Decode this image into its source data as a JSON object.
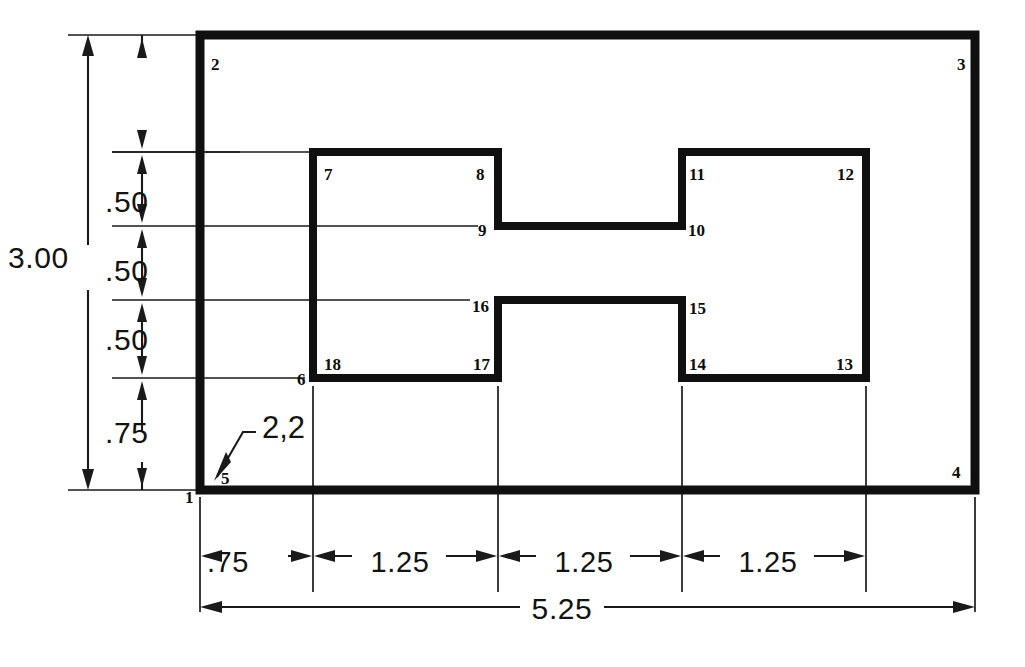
{
  "drawing": {
    "type": "orthographic-part-outline",
    "units": "inches",
    "overall_width": "5.25",
    "overall_height": "3.00"
  },
  "vertex_labels": [
    {
      "id": "1",
      "text": "1",
      "x": 185,
      "y": 503
    },
    {
      "id": "2",
      "text": "2",
      "x": 211,
      "y": 70
    },
    {
      "id": "3",
      "text": "3",
      "x": 957,
      "y": 70
    },
    {
      "id": "4",
      "text": "4",
      "x": 952,
      "y": 478
    },
    {
      "id": "5",
      "text": "5",
      "x": 221,
      "y": 484
    },
    {
      "id": "6",
      "text": "6",
      "x": 297,
      "y": 385
    },
    {
      "id": "7",
      "text": "7",
      "x": 324,
      "y": 180
    },
    {
      "id": "8",
      "text": "8",
      "x": 476,
      "y": 180
    },
    {
      "id": "9",
      "text": "9",
      "x": 478,
      "y": 236
    },
    {
      "id": "10",
      "text": "10",
      "x": 688,
      "y": 236
    },
    {
      "id": "11",
      "text": "11",
      "x": 689,
      "y": 180
    },
    {
      "id": "12",
      "text": "12",
      "x": 837,
      "y": 180
    },
    {
      "id": "13",
      "text": "13",
      "x": 836,
      "y": 370
    },
    {
      "id": "14",
      "text": "14",
      "x": 689,
      "y": 370
    },
    {
      "id": "15",
      "text": "15",
      "x": 689,
      "y": 314
    },
    {
      "id": "16",
      "text": "16",
      "x": 472,
      "y": 312
    },
    {
      "id": "17",
      "text": "17",
      "x": 473,
      "y": 370
    },
    {
      "id": "18",
      "text": "18",
      "x": 324,
      "y": 370
    }
  ],
  "leader_note": {
    "label": "2,2",
    "text_x": 262,
    "text_y": 438,
    "tip_x": 214,
    "tip_y": 480
  },
  "vertical_dimensions": {
    "overall": {
      "label": "3.00",
      "text_x": 8,
      "text_y": 268
    },
    "chain": [
      {
        "label": ".50",
        "text_x": 105,
        "text_y": 212
      },
      {
        "label": ".50",
        "text_x": 105,
        "text_y": 281
      },
      {
        "label": ".50",
        "text_x": 105,
        "text_y": 350
      },
      {
        "label": ".75",
        "text_x": 105,
        "text_y": 443
      }
    ]
  },
  "horizontal_dimensions": {
    "overall": {
      "label": "5.25",
      "text_x": 556,
      "text_y": 623
    },
    "chain": [
      {
        "label": ".75",
        "text_x": 228,
        "text_y": 572
      },
      {
        "label": "1.25",
        "text_x": 372,
        "text_y": 572
      },
      {
        "label": "1.25",
        "text_x": 556,
        "text_y": 572
      },
      {
        "label": "1.25",
        "text_x": 740,
        "text_y": 572
      }
    ]
  },
  "colors": {
    "ink": "#101010",
    "thin_line": "#1a1a1a",
    "paper": "#ffffff"
  }
}
